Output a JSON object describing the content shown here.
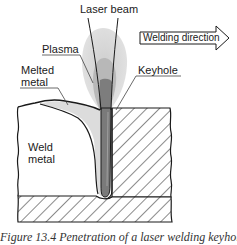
{
  "diagram": {
    "type": "laser keyhole welding cross-section",
    "labels": {
      "laser_beam": "Laser beam",
      "plasma": "Plasma",
      "melted_metal_line1": "Melted",
      "melted_metal_line2": "metal",
      "keyhole": "Keyhole",
      "weld_metal_line1": "Weld",
      "weld_metal_line2": "metal",
      "welding_direction": "Welding direction"
    },
    "caption": "Figure 13.4 Penetration of a laser welding keyhole",
    "colors": {
      "outline": "#1a1a1a",
      "plasma_outer": "#d9d9d9",
      "plasma_mid": "#b5b5b5",
      "keyhole_core": "#7a7a7a",
      "melted_metal": "#dcdcdc",
      "weld_metal": "#ffffff",
      "hatch": "#2a2a2a"
    }
  }
}
